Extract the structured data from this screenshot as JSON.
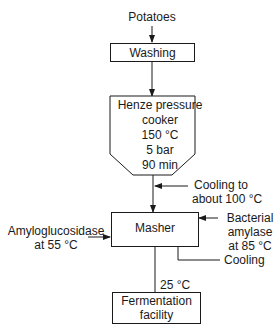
{
  "diagram": {
    "input": "Potatoes",
    "nodes": {
      "washing": "Washing",
      "cooker": {
        "title_line1": "Henze pressure",
        "title_line2": "cooker",
        "temp": "150 °C",
        "pressure": "5 bar",
        "time": "90 min"
      },
      "masher": "Masher",
      "fermentation_line1": "Fermentation",
      "fermentation_line2": "facility"
    },
    "side_inputs": {
      "cooling_line1": "Cooling to",
      "cooling_line2": "about 100 °C",
      "amyloglucosidase_line1": "Amyloglucosidase",
      "amyloglucosidase_line2": "at 55 °C",
      "bacterial_line1": "Bacterial",
      "bacterial_line2": "amylase",
      "bacterial_line3": "at 85 °C",
      "masher_cooling": "Cooling"
    },
    "transfer_temp": "25 °C"
  }
}
